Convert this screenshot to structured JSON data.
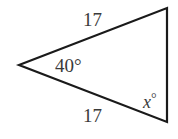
{
  "diagram": {
    "type": "isosceles-triangle",
    "vertices": {
      "apex": {
        "x": 19,
        "y": 65
      },
      "top_right": {
        "x": 167,
        "y": 8
      },
      "bottom_right": {
        "x": 167,
        "y": 122
      }
    },
    "labels": {
      "top_side": "17",
      "bottom_side": "17",
      "apex_angle": "40°",
      "base_angle_var": "x",
      "base_angle_deg": "°"
    },
    "stroke_color": "#1a1a1a",
    "text_color": "#3a3a3a"
  }
}
